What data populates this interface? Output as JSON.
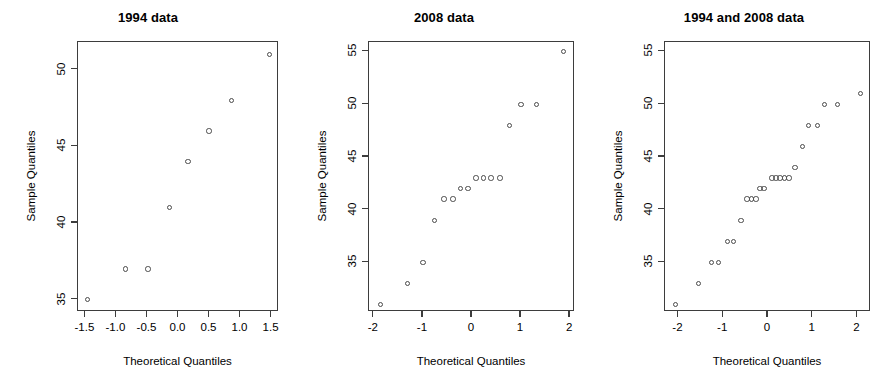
{
  "figure": {
    "background": "#ffffff",
    "point_color": "#4a4a4a",
    "axis_color": "#3d3d3d",
    "width": 892,
    "height": 388
  },
  "chart_data": [
    {
      "type": "scatter",
      "title": "1994 data",
      "xlabel": "Theoretical Quantiles",
      "ylabel": "Sample Quantiles",
      "xlim": [
        -1.62,
        1.62
      ],
      "ylim": [
        34.2,
        51.8
      ],
      "xticks": [
        -1.5,
        -1.0,
        -0.5,
        0.0,
        0.5,
        1.0,
        1.5
      ],
      "xticklabels": [
        "-1.5",
        "-1.0",
        "-0.5",
        "0.0",
        "0.5",
        "1.0",
        "1.5"
      ],
      "yticks": [
        35,
        40,
        45,
        50
      ],
      "yticklabels": [
        "35",
        "40",
        "45",
        "50"
      ],
      "grid": false,
      "legend": "none",
      "x": [
        -1.47,
        -0.85,
        -0.49,
        -0.15,
        0.15,
        0.49,
        0.85,
        1.47
      ],
      "y": [
        35,
        37,
        37,
        41,
        44,
        46,
        48,
        51
      ]
    },
    {
      "type": "scatter",
      "title": "2008 data",
      "xlabel": "Theoretical Quantiles",
      "ylabel": "Sample Quantiles",
      "xlim": [
        -2.1,
        2.1
      ],
      "ylim": [
        30.3,
        55.9
      ],
      "xticks": [
        -2,
        -1,
        0,
        1,
        2
      ],
      "xticklabels": [
        "-2",
        "-1",
        "0",
        "1",
        "2"
      ],
      "yticks": [
        35,
        40,
        45,
        50,
        55
      ],
      "yticklabels": [
        "35",
        "40",
        "45",
        "50",
        "55"
      ],
      "grid": false,
      "legend": "none",
      "x": [
        -1.87,
        -1.32,
        -1.0,
        -0.76,
        -0.57,
        -0.39,
        -0.23,
        -0.08,
        0.08,
        0.23,
        0.39,
        0.57,
        0.76,
        1.0,
        1.32,
        1.87
      ],
      "y": [
        31,
        33,
        35,
        39,
        41,
        41,
        42,
        42,
        43,
        43,
        43,
        43,
        48,
        50,
        50,
        55
      ]
    },
    {
      "type": "scatter",
      "title": "1994 and 2008 data",
      "xlabel": "Theoretical Quantiles",
      "ylabel": "Sample Quantiles",
      "xlim": [
        -2.3,
        2.3
      ],
      "ylim": [
        30.3,
        55.9
      ],
      "xticks": [
        -2,
        -1,
        0,
        1,
        2
      ],
      "xticklabels": [
        "-2",
        "-1",
        "0",
        "1",
        "2"
      ],
      "yticks": [
        35,
        40,
        45,
        50,
        55
      ],
      "yticklabels": [
        "35",
        "40",
        "45",
        "50",
        "55"
      ],
      "grid": false,
      "legend": "none",
      "x": [
        -2.06,
        -1.55,
        -1.26,
        -1.11,
        -0.91,
        -0.77,
        -0.6,
        -0.47,
        -0.37,
        -0.27,
        -0.18,
        -0.09,
        0.09,
        0.18,
        0.27,
        0.37,
        0.47,
        0.6,
        0.77,
        0.91,
        1.11,
        1.26,
        1.55,
        2.06
      ],
      "y": [
        31,
        33,
        35,
        35,
        37,
        37,
        39,
        41,
        41,
        41,
        42,
        42,
        43,
        43,
        43,
        43,
        43,
        44,
        46,
        48,
        48,
        50,
        50,
        51
      ]
    }
  ],
  "panels_layout": [
    {
      "left": 0,
      "width": 296,
      "box": {
        "x": 77,
        "y": 41,
        "w": 201,
        "h": 270
      }
    },
    {
      "left": 296,
      "width": 296,
      "box": {
        "x": 72,
        "y": 41,
        "w": 206,
        "h": 270
      }
    },
    {
      "left": 596,
      "width": 296,
      "box": {
        "x": 68,
        "y": 41,
        "w": 206,
        "h": 270
      }
    }
  ]
}
